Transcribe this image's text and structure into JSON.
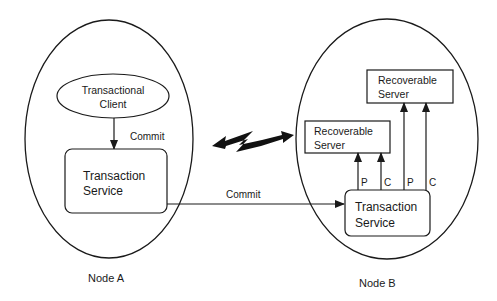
{
  "diagram": {
    "colors": {
      "stroke": "#1a1a1a",
      "background": "#ffffff"
    },
    "node_a": {
      "label": "Node A",
      "client": {
        "line1": "Transactional",
        "line2": "Client"
      },
      "client_arrow_label": "Commit",
      "transaction_service": {
        "line1": "Transaction",
        "line2": "Service"
      }
    },
    "node_b": {
      "label": "Node B",
      "transaction_service": {
        "line1": "Transaction",
        "line2": "Service"
      },
      "server_lower": {
        "line1": "Recoverable",
        "line2": "Server"
      },
      "server_upper": {
        "line1": "Recoverable",
        "line2": "Server"
      },
      "arrow_labels": [
        "P",
        "C",
        "P",
        "C"
      ]
    },
    "inter_node_arrow_label": "Commit",
    "network_icon": "lightning-bolt-icon"
  }
}
